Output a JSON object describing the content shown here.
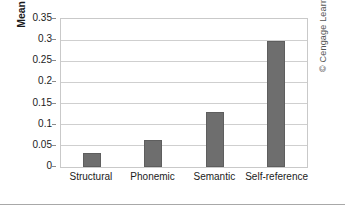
{
  "chart_data": {
    "type": "bar",
    "title": "",
    "subtitle": "",
    "xlabel": "",
    "ylabel": "Mean adjusted recall",
    "categories": [
      "Structural",
      "Phonemic",
      "Semantic",
      "Self-reference"
    ],
    "values": [
      0.032,
      0.065,
      0.13,
      0.297
    ],
    "series": [
      {
        "name": "Mean adjusted recall",
        "values": [
          0.032,
          0.065,
          0.13,
          0.297
        ]
      }
    ],
    "ylim": [
      0,
      0.35
    ],
    "xlim_categories": 4,
    "y_ticks": [
      0,
      0.05,
      0.1,
      0.15,
      0.2,
      0.25,
      0.3,
      0.35
    ],
    "y_tick_labels": [
      "0",
      "0.05",
      "0.1",
      "0.15",
      "0.2",
      "0.25",
      "0.3",
      "0.35"
    ],
    "grid": true,
    "grid_axis": "y",
    "legend": false,
    "legend_position": "none",
    "bar_color": "#6e6e6e",
    "bar_edge_color": "#5e5e5e",
    "gridline_color": "#cfcfcf",
    "plot_border_color": "#c9c9c9",
    "text_color": "#1b1b1b",
    "background_color": "#ffffff",
    "annotations": []
  },
  "credit": {
    "text": "© Cengage Learning 2013",
    "color": "#555555"
  }
}
